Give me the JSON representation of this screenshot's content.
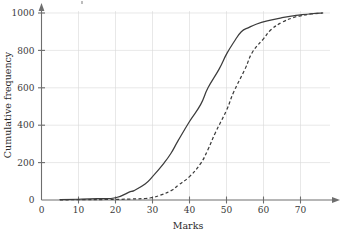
{
  "chart_data": {
    "type": "line",
    "title": "",
    "xlabel": "Marks",
    "ylabel": "Cumulative frequency",
    "xlim": [
      0,
      78
    ],
    "ylim": [
      0,
      1010
    ],
    "xticks": [
      0,
      10,
      20,
      30,
      40,
      50,
      60,
      70
    ],
    "yticks": [
      0,
      200,
      400,
      600,
      800,
      1000
    ],
    "xtick_labels": [
      "0",
      "10",
      "20",
      "30",
      "40",
      "50",
      "60",
      "70"
    ],
    "ytick_labels": [
      "0",
      "200",
      "400",
      "600",
      "800",
      "1000"
    ],
    "grid": true,
    "legend": "none",
    "series": [
      {
        "name": "solid-curve",
        "style": "solid",
        "color": "#3c3c3c",
        "x": [
          5,
          10,
          15,
          20,
          24,
          25,
          28,
          30,
          33,
          35,
          37,
          40,
          43,
          45,
          48,
          50,
          52,
          54,
          56,
          58,
          61,
          65,
          68,
          70,
          73,
          76
        ],
        "y": [
          2,
          4,
          7,
          12,
          45,
          50,
          85,
          125,
          195,
          250,
          320,
          420,
          510,
          600,
          700,
          780,
          845,
          900,
          922,
          940,
          958,
          975,
          985,
          990,
          996,
          1000
        ]
      },
      {
        "name": "dashed-curve",
        "style": "dashed",
        "color": "#3c3c3c",
        "x": [
          5,
          12,
          18,
          24,
          28,
          30,
          32,
          35,
          37,
          40,
          43,
          45,
          47,
          50,
          52,
          55,
          57,
          60,
          62,
          65,
          68,
          70,
          73,
          76
        ],
        "y": [
          1,
          2,
          3,
          5,
          8,
          14,
          25,
          50,
          80,
          125,
          195,
          270,
          360,
          480,
          580,
          700,
          790,
          862,
          910,
          950,
          975,
          985,
          995,
          1000
        ]
      }
    ]
  },
  "axes": {
    "x_axis_label": "Marks",
    "y_axis_label": "Cumulative frequency"
  }
}
